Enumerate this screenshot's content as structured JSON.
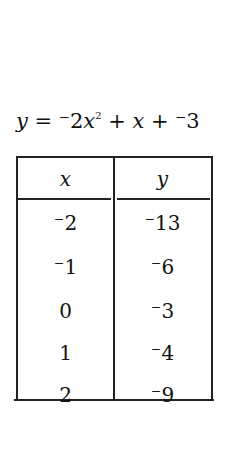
{
  "equation": {
    "lhs": "y",
    "eq": " = ",
    "coef": "⁻2",
    "var1": "x",
    "exp": "2",
    "plus1": " + ",
    "var2": "x",
    "plus2": " + ",
    "const": "⁻3"
  },
  "table": {
    "headers": [
      "x",
      "y"
    ],
    "rows": [
      {
        "x": "⁻2",
        "y": "⁻13"
      },
      {
        "x": "⁻1",
        "y": "⁻6"
      },
      {
        "x": "0",
        "y": "⁻3"
      },
      {
        "x": "1",
        "y": "⁻4"
      },
      {
        "x": "2",
        "y": "⁻9"
      }
    ]
  }
}
